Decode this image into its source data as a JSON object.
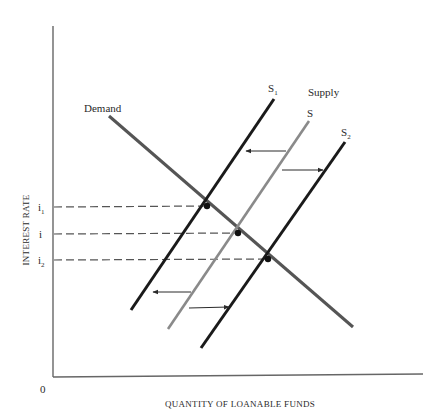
{
  "diagram": {
    "axes": {
      "y_label": "INTEREST RATE",
      "x_label": "QUANTITY OF LOANABLE FUNDS",
      "origin_label": "0"
    },
    "rate_ticks": [
      {
        "base": "i",
        "sub": "1",
        "y": 207
      },
      {
        "base": "i",
        "sub": "",
        "y": 234
      },
      {
        "base": "i",
        "sub": "2",
        "y": 260
      }
    ],
    "curves": {
      "demand": {
        "label": "Demand",
        "color": "#555555",
        "from": [
          109,
          116
        ],
        "to": [
          353,
          327
        ]
      },
      "s1": {
        "base": "S",
        "sub": "1",
        "color": "#1a1a1a",
        "from": [
          131,
          310
        ],
        "to": [
          274,
          99
        ]
      },
      "s": {
        "base": "S",
        "sub": "",
        "color": "#8a8a8a",
        "from": [
          168,
          329
        ],
        "to": [
          309,
          121
        ]
      },
      "s2": {
        "base": "S",
        "sub": "2",
        "color": "#1a1a1a",
        "from": [
          201,
          348
        ],
        "to": [
          345,
          142
        ]
      }
    },
    "supply_group_label": "Supply",
    "equilibria": [
      {
        "x": 207,
        "y": 207
      },
      {
        "x": 238,
        "y": 234
      },
      {
        "x": 268,
        "y": 260
      }
    ],
    "shift_arrows": [
      {
        "direction": "left",
        "from": [
          286,
          151
        ],
        "to": [
          246,
          151
        ]
      },
      {
        "direction": "right",
        "from": [
          282,
          170
        ],
        "to": [
          323,
          170
        ]
      },
      {
        "direction": "left",
        "from": [
          191,
          292
        ],
        "to": [
          153,
          292
        ]
      },
      {
        "direction": "right",
        "from": [
          189,
          308
        ],
        "to": [
          229,
          307
        ]
      }
    ]
  }
}
